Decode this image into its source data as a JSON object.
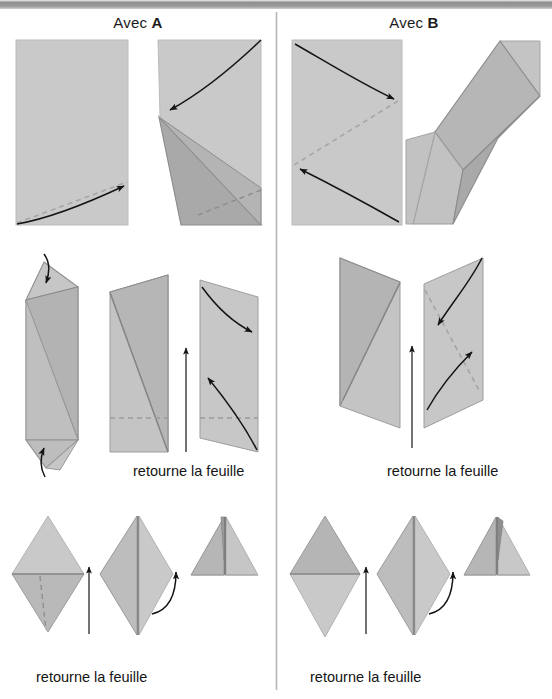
{
  "page": {
    "width": 552,
    "height": 699,
    "background": "#ffffff",
    "type": "origami-folding-instructions",
    "language": "fr"
  },
  "topbar": {
    "name": "page-header-bar",
    "gradient_from": "#f2f2f2",
    "gradient_to": "#cfcfcf"
  },
  "columns": {
    "divider": {
      "x": 276,
      "y_start": 12,
      "y_end": 690,
      "color": "#b0b0b0"
    },
    "left": {
      "title_prefix": "Avec ",
      "title_letter": "A",
      "title_full": "Avec A"
    },
    "right": {
      "title_prefix": "Avec ",
      "title_letter": "B",
      "title_full": "Avec B"
    }
  },
  "captions": [
    {
      "id": "cap-left-mid",
      "text": "retourne la feuille",
      "x": 133,
      "y": 463
    },
    {
      "id": "cap-right-mid",
      "text": "retourne la feuille",
      "x": 387,
      "y": 463
    },
    {
      "id": "cap-left-bottom",
      "text": "retourne la feuille",
      "x": 36,
      "y": 669
    },
    {
      "id": "cap-right-bottom",
      "text": "retourne la feuille",
      "x": 310,
      "y": 669
    }
  ],
  "palette": {
    "paper_light": "#c9c9c9",
    "paper_mid": "#bdbdbd",
    "paper_dark": "#a9a9a9",
    "paper_darker": "#9e9e9e",
    "edge": "#8a8a8a",
    "crease_dashed": "#9a9a9a",
    "arrow": "#141414",
    "text": "#151515",
    "divider": "#b0b0b0"
  },
  "steps": {
    "row1": {
      "label": "step-row-1",
      "left": [
        {
          "name": "figure-a1-rectangle",
          "kind": "rectangle-with-diagonal-valley-fold"
        },
        {
          "name": "figure-a2-folded-triangle",
          "kind": "corner-folded-triangle"
        }
      ],
      "right": [
        {
          "name": "figure-b1-rectangle",
          "kind": "rectangle-with-diagonal-valley-fold"
        },
        {
          "name": "figure-b2-parallelogram",
          "kind": "folded-parallelogram"
        }
      ]
    },
    "row2": {
      "label": "step-row-2",
      "left": [
        {
          "name": "figure-a3-long-fold",
          "kind": "narrow-folded-strip"
        },
        {
          "name": "figure-a4-flipped",
          "kind": "trapezoid-front"
        },
        {
          "name": "figure-a5-fold-arrows",
          "kind": "trapezoid-with-fold-arrows"
        }
      ],
      "right": [
        {
          "name": "figure-b3-flipped",
          "kind": "trapezoid-front"
        },
        {
          "name": "figure-b4-fold-arrows",
          "kind": "trapezoid-with-fold-arrows"
        }
      ]
    },
    "row3": {
      "label": "step-row-3",
      "left": [
        {
          "name": "figure-a6-diamond",
          "kind": "diamond-two-tone"
        },
        {
          "name": "figure-a7-diamond-folded",
          "kind": "diamond-center-crease"
        },
        {
          "name": "figure-a8-triangle",
          "kind": "final-triangle"
        }
      ],
      "right": [
        {
          "name": "figure-b6-diamond",
          "kind": "diamond-two-tone"
        },
        {
          "name": "figure-b7-diamond-folded",
          "kind": "diamond-center-crease"
        },
        {
          "name": "figure-b8-triangle",
          "kind": "final-triangle"
        }
      ]
    }
  }
}
